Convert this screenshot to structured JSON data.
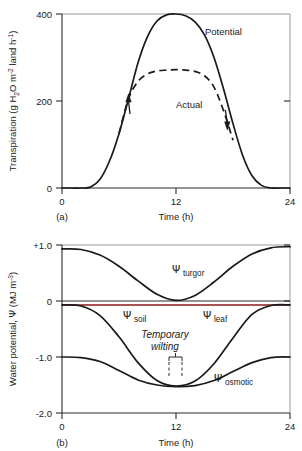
{
  "figure": {
    "panels": [
      {
        "id": "panel-a",
        "label": "(a)",
        "xlabel": "Time (h)",
        "ylabel_main": "Transpiration (g H",
        "ylabel_sub1": "2",
        "ylabel_mid": "O m",
        "ylabel_sup1": "-2",
        "ylabel_mid2": " land h",
        "ylabel_sup2": "-1",
        "ylabel_end": ")",
        "xticks": [
          "0",
          "12",
          "24"
        ],
        "yticks": [
          "0",
          "200",
          "400"
        ],
        "curve_labels": [
          "Potential",
          "Actual"
        ]
      },
      {
        "id": "panel-b",
        "label": "(b)",
        "xlabel": "Time (h)",
        "ylabel_main": "Water potential, ",
        "ylabel_psi": "Ψ",
        "ylabel_unit": " (MJ m",
        "ylabel_sup": "-3",
        "ylabel_end": ")",
        "xticks": [
          "0",
          "12",
          "24"
        ],
        "yticks": [
          "+1.0",
          "0",
          "-1.0",
          "-2.0"
        ],
        "psi_symbol": "Ψ",
        "curve_labels": [
          "turgor",
          "soil",
          "leaf",
          "osmotic"
        ],
        "annotation_line1": "Temporary",
        "annotation_line2": "wilting"
      }
    ]
  },
  "chart_data": [
    {
      "type": "line",
      "id": "panel-a-transpiration",
      "title": "",
      "xlabel": "Time (h)",
      "ylabel": "Transpiration (g H2O m-2 land h-1)",
      "xlim": [
        0,
        24
      ],
      "ylim": [
        0,
        400
      ],
      "xticks": [
        0,
        12,
        24
      ],
      "yticks": [
        0,
        200,
        400
      ],
      "grid": false,
      "legend": "inline-labels",
      "series": [
        {
          "name": "Potential",
          "style": "solid",
          "color": "#1a1a1a",
          "x": [
            0,
            1,
            2,
            3,
            4,
            5,
            6,
            7,
            8,
            9,
            10,
            11,
            12,
            13,
            14,
            15,
            16,
            17,
            18,
            19,
            20,
            21,
            22,
            23,
            24
          ],
          "y": [
            0,
            0,
            0,
            2,
            20,
            62,
            125,
            205,
            288,
            348,
            384,
            398,
            400,
            396,
            382,
            352,
            300,
            228,
            148,
            76,
            28,
            6,
            0,
            0,
            0
          ]
        },
        {
          "name": "Actual",
          "style": "dashed",
          "color": "#1a1a1a",
          "x": [
            6,
            7,
            8,
            9,
            10,
            11,
            12,
            13,
            14,
            15,
            16,
            17,
            18
          ],
          "y": [
            125,
            205,
            245,
            262,
            269,
            271,
            272,
            271,
            268,
            258,
            232,
            178,
            110
          ]
        }
      ],
      "annotations": [
        {
          "type": "arrow",
          "direction": "up",
          "on_series": "Potential",
          "x": 7.0,
          "y": 200
        },
        {
          "type": "arrow",
          "direction": "down",
          "on_series": "Actual",
          "x": 17.4,
          "y": 150
        }
      ]
    },
    {
      "type": "line",
      "id": "panel-b-water-potential",
      "title": "",
      "xlabel": "Time (h)",
      "ylabel": "Water potential, Ψ (MJ m-3)",
      "xlim": [
        0,
        24
      ],
      "ylim": [
        -2.0,
        1.0
      ],
      "xticks": [
        0,
        12,
        24
      ],
      "yticks": [
        1.0,
        0,
        -1.0,
        -2.0
      ],
      "grid": false,
      "legend": "inline-labels",
      "series": [
        {
          "name": "Ψ turgor",
          "style": "solid",
          "color": "#1a1a1a",
          "x": [
            0,
            2,
            4,
            6,
            8,
            10,
            12,
            14,
            16,
            18,
            20,
            22,
            24
          ],
          "y": [
            0.93,
            0.92,
            0.82,
            0.62,
            0.36,
            0.12,
            0.01,
            0.1,
            0.34,
            0.62,
            0.84,
            0.95,
            0.97
          ]
        },
        {
          "name": "Ψ soil",
          "style": "solid",
          "color": "#8b1a1a",
          "x": [
            0,
            24
          ],
          "y": [
            -0.07,
            -0.07
          ]
        },
        {
          "name": "Ψ leaf",
          "style": "solid",
          "color": "#1a1a1a",
          "x": [
            0,
            2,
            4,
            6,
            8,
            10,
            12,
            14,
            16,
            18,
            20,
            22,
            24
          ],
          "y": [
            -0.07,
            -0.09,
            -0.26,
            -0.64,
            -1.1,
            -1.42,
            -1.52,
            -1.43,
            -1.12,
            -0.66,
            -0.24,
            -0.08,
            -0.07
          ]
        },
        {
          "name": "Ψ osmotic",
          "style": "solid",
          "color": "#1a1a1a",
          "x": [
            0,
            2,
            4,
            6,
            8,
            10,
            12,
            14,
            16,
            18,
            20,
            22,
            24
          ],
          "y": [
            -1.0,
            -1.01,
            -1.08,
            -1.24,
            -1.41,
            -1.5,
            -1.53,
            -1.51,
            -1.42,
            -1.26,
            -1.1,
            -1.01,
            -1.0
          ]
        }
      ],
      "annotations": [
        {
          "type": "bracket-text",
          "text": "Temporary wilting",
          "x_range": [
            11.3,
            12.7
          ],
          "y": -1.15
        }
      ]
    }
  ]
}
